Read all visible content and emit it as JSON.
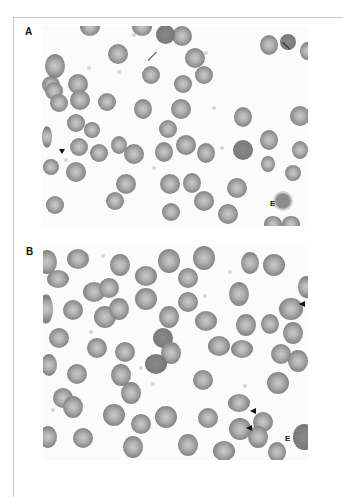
{
  "figure": {
    "panels": [
      {
        "label": "A",
        "annotations": {
          "echinocyte_label": "E",
          "arrows": [
            "arrow",
            "arrow"
          ],
          "arrowheads": [
            "arrowhead"
          ]
        }
      },
      {
        "label": "B",
        "annotations": {
          "echinocyte_label": "E",
          "arrowheads": [
            "arrowhead",
            "arrowhead",
            "arrowhead"
          ]
        }
      }
    ],
    "colors": {
      "background": "#ffffff",
      "cell_rim": "#7d7d7d",
      "cell_center": "#c9c9c9",
      "annotation": "#111111",
      "frame": "#c8c8c8"
    }
  }
}
